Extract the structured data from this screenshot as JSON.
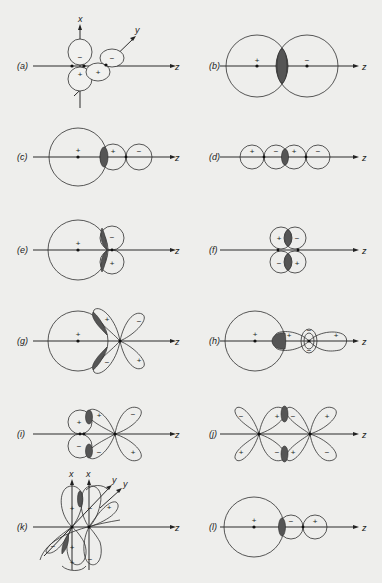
{
  "figure": {
    "axis_label_z": "z",
    "axis_label_x": "x",
    "axis_label_y": "y",
    "plus": "+",
    "minus": "−",
    "shaded_region_color": "#555555",
    "panels": [
      {
        "id": "a",
        "label": "(a)",
        "description": "p_x and p_y orbitals on separate atoms — zero overlap",
        "signs": [
          "−",
          "+",
          "+",
          "−"
        ]
      },
      {
        "id": "b",
        "label": "(b)",
        "description": "s–s overlap, opposite phases",
        "signs": [
          "+",
          "−"
        ]
      },
      {
        "id": "c",
        "label": "(c)",
        "description": "s–p_z positive overlap",
        "signs": [
          "+",
          "+",
          "−"
        ]
      },
      {
        "id": "d",
        "label": "(d)",
        "description": "p_z–p_z sigma overlap",
        "signs": [
          "+",
          "−",
          "+",
          "−"
        ]
      },
      {
        "id": "e",
        "label": "(e)",
        "description": "s–p_x: cancelling overlap",
        "signs": [
          "+",
          "−",
          "+"
        ]
      },
      {
        "id": "f",
        "label": "(f)",
        "description": "p_x–p_x pi overlap",
        "signs": [
          "+",
          "−",
          "−",
          "+"
        ]
      },
      {
        "id": "g",
        "label": "(g)",
        "description": "s–d_xz: cancelling overlap",
        "signs": [
          "+",
          "+",
          "−",
          "−",
          "+"
        ]
      },
      {
        "id": "h",
        "label": "(h)",
        "description": "s–d_z2 overlap",
        "signs": [
          "+",
          "+",
          "−",
          "−",
          "+"
        ]
      },
      {
        "id": "i",
        "label": "(i)",
        "description": "p_x–d_xz pi overlap",
        "signs": [
          "+",
          "−",
          "+",
          "−",
          "−",
          "+"
        ]
      },
      {
        "id": "j",
        "label": "(j)",
        "description": "d_xz–d_xz pi overlap",
        "signs": [
          "−",
          "+",
          "+",
          "−",
          "−",
          "+",
          "+",
          "−"
        ]
      },
      {
        "id": "k",
        "label": "(k)",
        "description": "d_xz–p_x / d_xy orbital overlap (3D view)",
        "signs": [
          "+",
          "−",
          "+",
          "−",
          "+",
          "+",
          "−"
        ]
      },
      {
        "id": "l",
        "label": "(l)",
        "description": "s–p_z overlap, sign reversed",
        "signs": [
          "+",
          "−",
          "+"
        ]
      }
    ]
  }
}
